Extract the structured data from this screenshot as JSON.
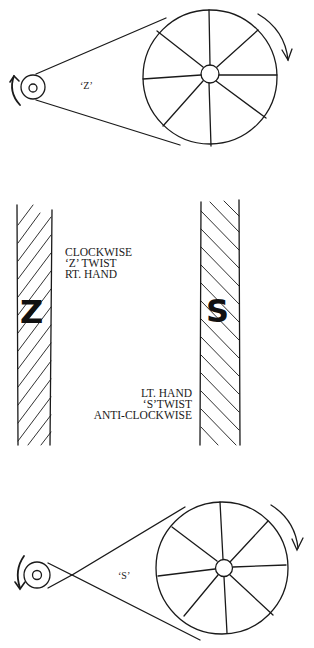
{
  "top_diagram": {
    "belt_label": "‘Z’",
    "description": "Open belt drive, wheel turning clockwise, spindle clockwise"
  },
  "middle": {
    "left_strand": {
      "letter": "Z",
      "labels": [
        "CLOCKWISE",
        "‘Z’ TWIST",
        "RT. HAND"
      ]
    },
    "right_strand": {
      "letter": "S",
      "labels": [
        "LT. HAND",
        "‘S’TWIST",
        "ANTI-CLOCKWISE"
      ]
    }
  },
  "bottom_diagram": {
    "belt_label": "‘S’",
    "description": "Crossed belt drive, wheel turning clockwise, spindle anti-clockwise"
  },
  "colors": {
    "ink": "#1a1a1a",
    "background": "#ffffff"
  }
}
